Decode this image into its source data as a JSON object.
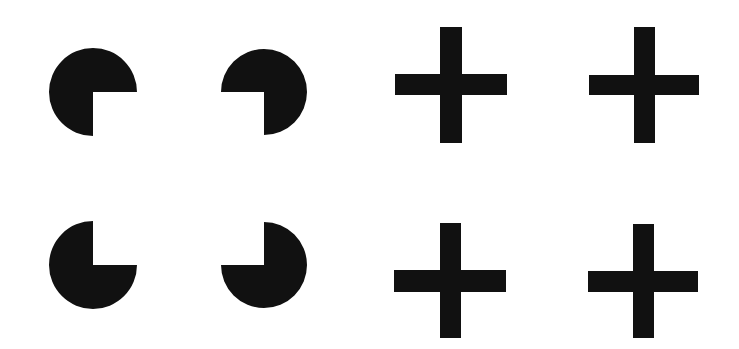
{
  "figure": {
    "background_color": "#ffffff",
    "fill_color": "#111111",
    "pacmen": [
      {
        "id": "top-left",
        "cx": 93,
        "cy": 92,
        "r": 44,
        "missing_quadrant": "bottom-right"
      },
      {
        "id": "top-right",
        "cx": 264,
        "cy": 92,
        "r": 43,
        "missing_quadrant": "bottom-left"
      },
      {
        "id": "bottom-left",
        "cx": 93,
        "cy": 265,
        "r": 44,
        "missing_quadrant": "top-right"
      },
      {
        "id": "bottom-right",
        "cx": 264,
        "cy": 265,
        "r": 43,
        "missing_quadrant": "top-left"
      }
    ],
    "crosses": [
      {
        "id": "top-left",
        "v": {
          "x": 440,
          "y": 27,
          "w": 22,
          "h": 116
        },
        "h": {
          "x": 395,
          "y": 74,
          "w": 112,
          "h": 21
        }
      },
      {
        "id": "top-right",
        "v": {
          "x": 634,
          "y": 27,
          "w": 21,
          "h": 116
        },
        "h": {
          "x": 589,
          "y": 75,
          "w": 110,
          "h": 20
        }
      },
      {
        "id": "bottom-left",
        "v": {
          "x": 440,
          "y": 223,
          "w": 21,
          "h": 115
        },
        "h": {
          "x": 394,
          "y": 270,
          "w": 112,
          "h": 22
        }
      },
      {
        "id": "bottom-right",
        "v": {
          "x": 633,
          "y": 224,
          "w": 21,
          "h": 114
        },
        "h": {
          "x": 588,
          "y": 271,
          "w": 110,
          "h": 21
        }
      }
    ]
  }
}
